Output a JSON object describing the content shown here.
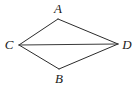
{
  "figure": {
    "type": "geometry-diagram",
    "shape_name": "quadrilateral",
    "background_color": "#ffffff",
    "stroke_color": "#2b2b2b",
    "diagonal_color": "#3a3a3a",
    "label_color": "#1a1a1a",
    "canvas": {
      "width": 139,
      "height": 86
    },
    "vertices": [
      {
        "id": "A",
        "label": "A",
        "x": 58,
        "y": 19,
        "label_x": 58,
        "label_y": 8
      },
      {
        "id": "C",
        "label": "C",
        "x": 19,
        "y": 45,
        "label_x": 9,
        "label_y": 44
      },
      {
        "id": "B",
        "label": "B",
        "x": 59,
        "y": 69,
        "label_x": 59,
        "label_y": 78
      },
      {
        "id": "D",
        "label": "D",
        "x": 118,
        "y": 44,
        "label_x": 127,
        "label_y": 44
      }
    ],
    "edges": [
      {
        "id": "CA",
        "from": "C",
        "to": "A",
        "kind": "side"
      },
      {
        "id": "AD",
        "from": "A",
        "to": "D",
        "kind": "side"
      },
      {
        "id": "DB",
        "from": "D",
        "to": "B",
        "kind": "side"
      },
      {
        "id": "BC",
        "from": "B",
        "to": "C",
        "kind": "side"
      },
      {
        "id": "CD",
        "from": "C",
        "to": "D",
        "kind": "diagonal"
      }
    ]
  }
}
